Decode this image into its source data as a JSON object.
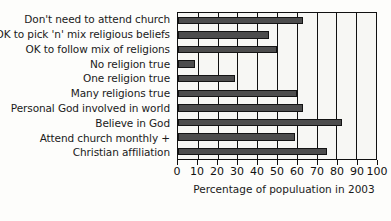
{
  "chart_data": {
    "type": "bar",
    "orientation": "horizontal",
    "title": "",
    "xlabel": "Percentage of populuation in 2003",
    "ylabel": "",
    "xlim": [
      0,
      100
    ],
    "grid": true,
    "legend": null,
    "xticks": [
      0,
      10,
      20,
      30,
      40,
      50,
      60,
      70,
      80,
      90,
      100
    ],
    "categories": [
      "Don't need to attend church",
      "OK to pick 'n' mix religious beliefs",
      "OK to follow mix of religions",
      "No religion true",
      "One religion true",
      "Many religions true",
      "Personal God involved in world",
      "Believe in God",
      "Attend church monthly +",
      "Christian affiliation"
    ],
    "values": [
      63,
      46,
      50,
      8.5,
      29,
      60,
      63,
      83,
      59,
      75
    ],
    "bar_color": "#4d4d4d",
    "bar_edge_color": "#141414",
    "plot_background": "#f7f7f4",
    "axis_color": "#111111"
  }
}
